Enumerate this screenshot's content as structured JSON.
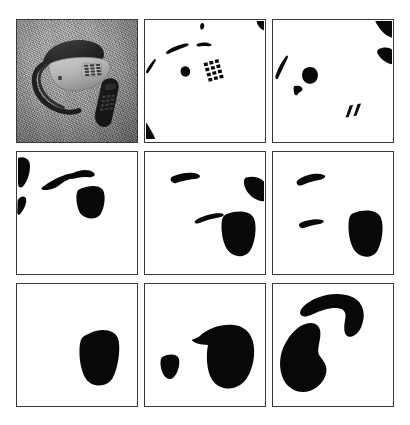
{
  "figure": {
    "layout": {
      "rows": 3,
      "columns": 3,
      "panel_count": 9
    },
    "colors": {
      "page_background": "#ffffff",
      "panel_background": "#ffffff",
      "panel_border": "#3a3a3a",
      "blob_fill": "#080808",
      "photo_gray_mid": "#9a9a9a",
      "photo_gray_dark": "#2a2a2a"
    },
    "panels": [
      {
        "index": 1,
        "position": "row-1-col-1",
        "type": "photograph",
        "description": "Grayscale photograph of a desk telephone with coiled handset cord and a separate dark keypad handset lying on a textured surface",
        "objects": [
          "telephone-base",
          "handset",
          "coiled-cord",
          "keypad-device"
        ],
        "blob_count": 0
      },
      {
        "index": 2,
        "position": "row-1-col-2",
        "type": "binary-segmentation",
        "description": "Finest scale: small scattered fragments including a 4x3 dot grid from the keypad buttons and corner fragments",
        "blob_count": 8,
        "has_keypad_dot_grid": true,
        "dot_grid_rows": 4,
        "dot_grid_cols": 3
      },
      {
        "index": 3,
        "position": "row-1-col-3",
        "type": "binary-segmentation",
        "description": "Fragments merge slightly: a round blob at center-left, curved slivers, two edge fragments on the right border and two small dashes at lower right",
        "blob_count": 7,
        "has_keypad_dot_grid": false
      },
      {
        "index": 4,
        "position": "row-2-col-1",
        "type": "binary-segmentation",
        "description": "Left-edge blob, thin sliver, curved handset fragment and a rounded rectangular keypad region",
        "blob_count": 5
      },
      {
        "index": 5,
        "position": "row-2-col-2",
        "type": "binary-segmentation",
        "description": "Tapered sliver upper-left, triangular fragment on right border, thin sliver and a large rounded keypad blob at lower right",
        "blob_count": 4
      },
      {
        "index": 6,
        "position": "row-2-col-3",
        "type": "binary-segmentation",
        "description": "Two slivers on the left and a single large rounded keypad blob at the right",
        "blob_count": 3
      },
      {
        "index": 7,
        "position": "row-3-col-1",
        "type": "binary-segmentation",
        "description": "Single rounded rectangular keypad blob at lower right; all other regions removed",
        "blob_count": 1
      },
      {
        "index": 8,
        "position": "row-3-col-2",
        "type": "binary-segmentation",
        "description": "Small blob at lower left and one large merged bird-shaped region on the right",
        "blob_count": 2
      },
      {
        "index": 9,
        "position": "row-3-col-3",
        "type": "binary-segmentation",
        "description": "Coarsest scale: a boomerang-shaped handset region at top and a large kidney-shaped telephone body region at lower left",
        "blob_count": 2
      }
    ]
  }
}
